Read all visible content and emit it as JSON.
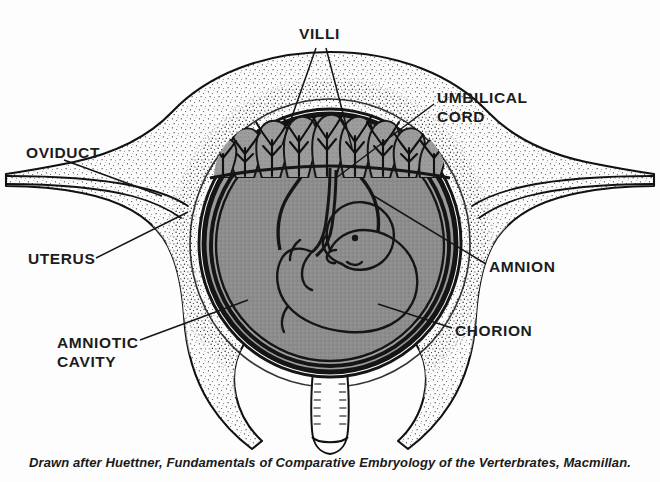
{
  "figure": {
    "caption": "Drawn after Huettner, Fundamentals of Comparative Embryology of the Verterbrates, Macmillan.",
    "width": 660,
    "height": 482,
    "background_color": "#fdfdfd"
  },
  "labels": {
    "villi": "VILLI",
    "umbilical_cord": "UMBILICAL\nCORD",
    "oviduct": "OVIDUCT",
    "uterus": "UTERUS",
    "amniotic_cavity": "AMNIOTIC\nCAVITY",
    "amnion": "AMNION",
    "chorion": "CHORION"
  },
  "colors": {
    "ink": "#111111",
    "amniotic_fluid_gray": "#8c8c8c",
    "villi_gray": "#9a9a9a",
    "chorion_dark": "#151515",
    "wall_fill": "#fcfcfc",
    "stipple": "#2a2a2a",
    "label_text": "#1c1c1c"
  },
  "structures": [
    {
      "name": "oviduct",
      "description": "paired tube entering uterus at upper left and upper right"
    },
    {
      "name": "uterus",
      "description": "thick stippled muscular wall enclosing the conceptus"
    },
    {
      "name": "chorion",
      "description": "dark outer fetal membrane ring bearing villi at the top"
    },
    {
      "name": "amnion",
      "description": "inner fetal membrane immediately around the fluid cavity"
    },
    {
      "name": "amniotic-cavity",
      "description": "gray fluid-filled space surrounding the fetus"
    },
    {
      "name": "villi",
      "description": "branching chorionic villi interdigitating with the uterine wall"
    },
    {
      "name": "umbilical-cord",
      "description": "cord running from fetal abdomen up to the placental region"
    },
    {
      "name": "fetus",
      "description": "curled embryo with large head, eye and limb buds"
    },
    {
      "name": "cervix",
      "description": "hatched canal at the base of the uterus"
    }
  ]
}
